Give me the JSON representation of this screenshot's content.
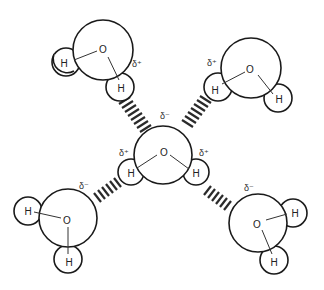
{
  "diagram": {
    "title": "",
    "colors": {
      "stroke": "#1a1a1a",
      "fill": "#ffffff",
      "text": "#222222"
    },
    "molecules": {
      "top_left": {
        "oxygen": "O",
        "h1": "H",
        "h2": "H",
        "charge": "δ⁺"
      },
      "top_right": {
        "oxygen": "O",
        "h1": "H",
        "h2": "H",
        "charge": "δ⁺"
      },
      "center": {
        "oxygen": "O",
        "h1": "H",
        "h2": "H",
        "charge_o": "δ⁻",
        "charge_h1": "δ⁺",
        "charge_h2": "δ⁺"
      },
      "bottom_left": {
        "oxygen": "O",
        "h1": "H",
        "h2": "H",
        "charge": "δ⁻"
      },
      "bottom_right": {
        "oxygen": "O",
        "h1": "H",
        "h2": "H",
        "charge": "δ⁻"
      }
    },
    "hydrogen_bonds": [
      "top-left-to-center",
      "top-right-to-center",
      "center-to-bottom-left",
      "center-to-bottom-right"
    ]
  }
}
